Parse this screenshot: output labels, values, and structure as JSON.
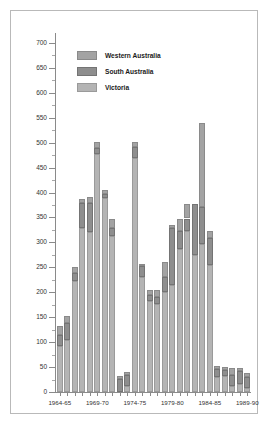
{
  "chart_data": {
    "type": "bar",
    "stacked": true,
    "title": "",
    "subtitle": "",
    "xlabel": "",
    "ylabel": "",
    "ylim": [
      0,
      720
    ],
    "ytick_step": 50,
    "yticks": [
      0,
      50,
      100,
      150,
      200,
      250,
      300,
      350,
      400,
      450,
      500,
      550,
      600,
      650,
      700
    ],
    "minor_ticks": true,
    "grid": false,
    "legend_position": "top-left",
    "axis_range_note": "y axis 0 to 700 labelled, minor ticks every 25",
    "categories": [
      "1964-65",
      "1965-66",
      "1966-67",
      "1967-68",
      "1968-69",
      "1969-70",
      "1970-71",
      "1971-72",
      "1972-73",
      "1973-74",
      "1974-75",
      "1975-76",
      "1976-77",
      "1977-78",
      "1978-79",
      "1979-80",
      "1980-81",
      "1981-82",
      "1982-83",
      "1983-84",
      "1984-85",
      "1985-86",
      "1986-87",
      "1987-88",
      "1988-89",
      "1989-90"
    ],
    "xtick_labels": [
      "1964-65",
      "1969-70",
      "1974-75",
      "1979-80",
      "1984-85",
      "1989-90"
    ],
    "xtick_indices": [
      0,
      5,
      10,
      15,
      20,
      25
    ],
    "series": [
      {
        "name": "Victoria",
        "color": "#b4b4b4",
        "values": [
          93,
          105,
          222,
          328,
          321,
          478,
          390,
          313,
          0,
          13,
          470,
          231,
          183,
          176,
          201,
          215,
          286,
          323,
          275,
          296,
          255,
          31,
          32,
          13,
          16,
          9
        ]
      },
      {
        "name": "South Australia",
        "color": "#8e8e8e",
        "values": [
          22,
          34,
          16,
          52,
          59,
          12,
          8,
          15,
          27,
          21,
          22,
          22,
          12,
          14,
          29,
          113,
          37,
          25,
          103,
          76,
          53,
          16,
          13,
          21,
          27,
          22
        ]
      },
      {
        "name": "Western Australia",
        "color": "#a3a3a3",
        "values": [
          17,
          13,
          13,
          7,
          12,
          12,
          7,
          20,
          6,
          6,
          10,
          3,
          10,
          14,
          31,
          6,
          25,
          30,
          0,
          168,
          14,
          6,
          5,
          15,
          5,
          7
        ]
      }
    ],
    "totals": [
      132,
      152,
      251,
      387,
      392,
      502,
      405,
      348,
      33,
      40,
      502,
      256,
      205,
      204,
      261,
      334,
      348,
      378,
      378,
      540,
      322,
      53,
      50,
      49,
      48,
      38
    ]
  },
  "legend": {
    "items": [
      {
        "label": "Western Australia",
        "swatch": "western-australia-swatch"
      },
      {
        "label": "South Australia",
        "swatch": "south-australia-swatch"
      },
      {
        "label": "Victoria",
        "swatch": "victoria-swatch"
      }
    ]
  },
  "colors": {
    "victoria": "#b4b4b4",
    "south_australia": "#8e8e8e",
    "western_australia": "#a3a3a3",
    "axis": "#8a8a8a",
    "frame": "#b9b9b9",
    "text": "#333333"
  }
}
